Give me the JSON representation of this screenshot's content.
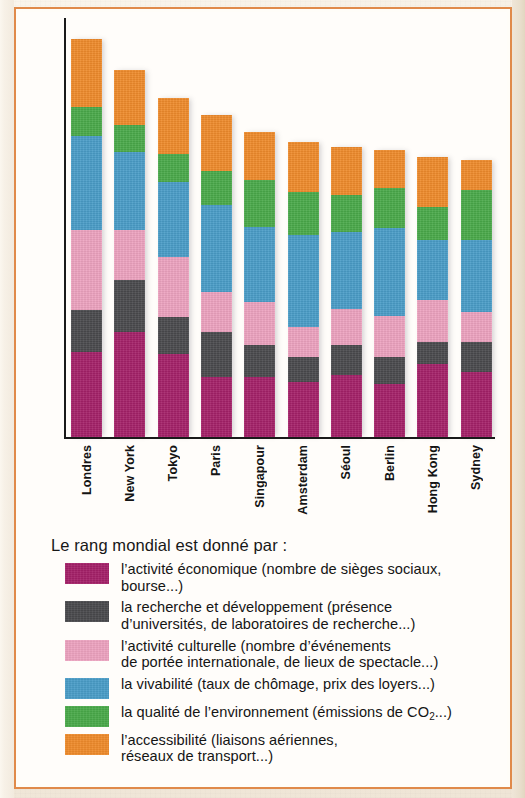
{
  "chart_data": {
    "type": "bar",
    "subtype": "stacked-bar",
    "title": "",
    "xlabel": "",
    "ylabel": "",
    "grid": false,
    "legend_position": "below",
    "ylim": [
      0,
      100
    ],
    "categories": [
      "Londres",
      "New York",
      "Tokyo",
      "Paris",
      "Singapour",
      "Amsterdam",
      "Séoul",
      "Berlin",
      "Hong Kong",
      "Sydney"
    ],
    "series": [
      {
        "name": "l'activité économique",
        "color": "#a52169",
        "values": [
          20.3,
          25.1,
          19.8,
          14.3,
          14.3,
          13.1,
          14.8,
          12.6,
          17.4,
          15.5
        ]
      },
      {
        "name": "la recherche et développement",
        "color": "#4a4a4d",
        "values": [
          10.0,
          12.4,
          8.8,
          10.7,
          7.6,
          6.0,
          7.2,
          6.4,
          5.3,
          7.2
        ]
      },
      {
        "name": "l'activité culturelle",
        "color": "#eda3c0",
        "values": [
          19.1,
          11.9,
          14.3,
          9.5,
          10.3,
          7.2,
          8.6,
          10.0,
          10.0,
          7.2
        ]
      },
      {
        "name": "la vivabilité",
        "color": "#4a9dc8",
        "values": [
          22.4,
          18.6,
          17.9,
          20.8,
          17.9,
          22.0,
          18.4,
          21.0,
          14.3,
          17.2
        ]
      },
      {
        "name": "la qualité de l'environnement",
        "color": "#4aaa4a",
        "values": [
          6.9,
          6.4,
          6.7,
          8.1,
          11.2,
          10.3,
          8.8,
          9.5,
          7.9,
          11.9
        ]
      },
      {
        "name": "l'accessibilité",
        "color": "#ef8b2b",
        "values": [
          16.2,
          13.1,
          13.4,
          13.4,
          11.4,
          11.9,
          11.4,
          9.0,
          11.9,
          7.2
        ]
      }
    ],
    "totals": [
      94.9,
      87.5,
      80.9,
      76.9,
      72.7,
      70.5,
      69.2,
      68.5,
      66.8,
      66.2
    ]
  },
  "legend": {
    "title": "Le rang mondial est donné par :",
    "items": [
      {
        "color_key": "economic",
        "color": "#a52169",
        "line1": "l’activité économique (nombre de sièges sociaux,",
        "line2": "bourse...)"
      },
      {
        "color_key": "research",
        "color": "#4a4a4d",
        "line1": "la recherche et développement (présence",
        "line2": "d’universités, de laboratoires de recherche...)"
      },
      {
        "color_key": "culture",
        "color": "#eda3c0",
        "line1": "l’activité culturelle (nombre d’événements",
        "line2": "de portée internationale, de lieux de spectacle...)"
      },
      {
        "color_key": "livability",
        "color": "#4a9dc8",
        "line1": "la vivabilité (taux de chômage, prix des loyers...)",
        "line2": ""
      },
      {
        "color_key": "environment",
        "color": "#4aaa4a",
        "line1": "la qualité de l’environnement (émissions de CO",
        "line2": ""
      },
      {
        "color_key": "accessibility",
        "color": "#ef8b2b",
        "line1": "l’accessibilité (liaisons aériennes,",
        "line2": "réseaux de transport...)"
      }
    ],
    "co2_sub": "2",
    "co2_tail": "...)"
  },
  "colors": {
    "frame": "#e08a4a",
    "paper": "#f1e8da",
    "plot_bg": "#fffdfa",
    "axis": "#1a1a1a"
  }
}
